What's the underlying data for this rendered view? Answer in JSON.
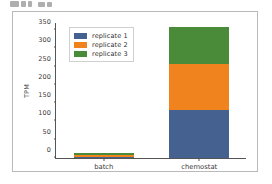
{
  "top_fragment": {
    "name": "cropped-ui-fragment-above-figure",
    "visible_text": ""
  },
  "figure": {
    "background": "#ffffff",
    "border_color": "#b9b9b9"
  },
  "chart_data": {
    "type": "bar",
    "stacked": true,
    "title": "",
    "xlabel": "",
    "ylabel": "TPM",
    "categories": [
      "batch",
      "chemostat"
    ],
    "series": [
      {
        "name": "replicate 1",
        "color": "#45618f",
        "values": [
          4,
          131
        ]
      },
      {
        "name": "replicate 2",
        "color": "#f0831e",
        "values": [
          4,
          125
        ]
      },
      {
        "name": "replicate 3",
        "color": "#4a8b3a",
        "values": [
          5,
          103
        ]
      }
    ],
    "totals": [
      13,
      359
    ],
    "ylim": [
      0,
      372
    ],
    "yticks": [
      0,
      50,
      100,
      150,
      200,
      250,
      300,
      350
    ],
    "ytick_labels": [
      "0",
      "50",
      "100",
      "150",
      "200",
      "250",
      "300",
      "350"
    ],
    "grid": false,
    "legend_position": "upper left",
    "legend_entries": [
      "replicate 1",
      "replicate 2",
      "replicate 3"
    ]
  }
}
